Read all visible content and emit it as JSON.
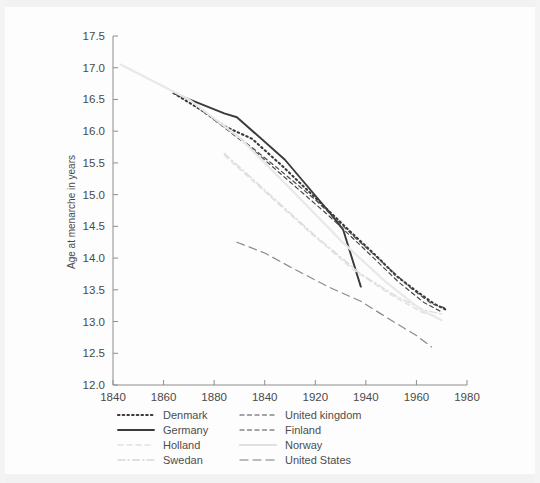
{
  "chart_data": {
    "type": "line",
    "title": "",
    "xlabel": "",
    "ylabel": "Age at menarche in years",
    "xlim": [
      1840,
      1980
    ],
    "ylim": [
      12.0,
      17.5
    ],
    "grid": false,
    "legend_position": "below-axes",
    "x_ticks": [
      1840,
      1860,
      1880,
      1840,
      1920,
      1940,
      1960,
      1980
    ],
    "x_tick_values": [
      1840,
      1860,
      1880,
      1900,
      1920,
      1940,
      1960,
      1980
    ],
    "y_ticks": [
      "12.0",
      "12.5",
      "13.0",
      "13.5",
      "14.0",
      "14.5",
      "15.0",
      "15.5",
      "16.0",
      "16.5",
      "17.0",
      "17.5"
    ],
    "y_tick_values": [
      12.0,
      12.5,
      13.0,
      13.5,
      14.0,
      14.5,
      15.0,
      15.5,
      16.0,
      16.5,
      17.0,
      17.5
    ],
    "series": [
      {
        "name": "Denmark",
        "style": "dotted",
        "color": "#3a3a3a",
        "x": [
          1864,
          1875,
          1884,
          1895,
          1907,
          1920,
          1933,
          1945,
          1952,
          1960,
          1967,
          1972
        ],
        "y": [
          16.6,
          16.33,
          16.08,
          15.88,
          15.45,
          14.95,
          14.45,
          14.0,
          13.72,
          13.48,
          13.28,
          13.18
        ]
      },
      {
        "name": "Germany",
        "style": "solid",
        "color": "#3a3a3a",
        "x": [
          1864,
          1884,
          1889,
          1908,
          1925,
          1931,
          1938
        ],
        "y": [
          16.6,
          16.28,
          16.22,
          15.55,
          14.75,
          14.45,
          13.55
        ]
      },
      {
        "name": "Holland",
        "style": "dashed",
        "color": "#e2e2e2",
        "x": [
          1884,
          1900,
          1918,
          1935,
          1950,
          1962,
          1968
        ],
        "y": [
          15.62,
          15.05,
          14.4,
          13.82,
          13.42,
          13.15,
          13.08
        ]
      },
      {
        "name": "Swedan",
        "style": "dashdot",
        "color": "#dcdcdc",
        "x": [
          1884,
          1902,
          1920,
          1938,
          1952,
          1963,
          1970
        ],
        "y": [
          15.65,
          15.0,
          14.35,
          13.75,
          13.4,
          13.18,
          13.12
        ]
      },
      {
        "name": "United kingdom",
        "style": "dashed-med",
        "color": "#4a4a4a",
        "x": [
          1876,
          1890,
          1905,
          1920,
          1935,
          1948,
          1958,
          1966,
          1971
        ],
        "y": [
          16.3,
          15.9,
          15.42,
          14.92,
          14.35,
          13.88,
          13.52,
          13.28,
          13.22
        ]
      },
      {
        "name": "Finland",
        "style": "dashed-med",
        "color": "#4a4a4a",
        "x": [
          1880,
          1895,
          1910,
          1925,
          1940,
          1953,
          1963,
          1970
        ],
        "y": [
          16.18,
          15.72,
          15.2,
          14.68,
          14.12,
          13.62,
          13.3,
          13.15
        ]
      },
      {
        "name": "Norway",
        "style": "solid-light",
        "color": "#e8e8e8",
        "x": [
          1843,
          1870,
          1890,
          1910,
          1930,
          1948,
          1962,
          1970
        ],
        "y": [
          17.05,
          16.5,
          15.9,
          15.1,
          14.28,
          13.62,
          13.18,
          13.02
        ]
      },
      {
        "name": "United States",
        "style": "longdash",
        "color": "#8a8a8a",
        "x": [
          1889,
          1900,
          1912,
          1925,
          1938,
          1950,
          1960,
          1966
        ],
        "y": [
          14.25,
          14.08,
          13.82,
          13.55,
          13.32,
          13.02,
          12.78,
          12.6
        ]
      }
    ]
  },
  "legend": {
    "column_left": [
      {
        "label": "Denmark",
        "style": "dotted",
        "color": "#3a3a3a"
      },
      {
        "label": "Germany",
        "style": "solid",
        "color": "#3a3a3a"
      },
      {
        "label": "Holland",
        "style": "dashed",
        "color": "#e0e0e0"
      },
      {
        "label": "Swedan",
        "style": "dashdot",
        "color": "#d8d8d8"
      }
    ],
    "column_right": [
      {
        "label": "United kingdom",
        "style": "dashed-med",
        "color": "#4a4a4a"
      },
      {
        "label": "Finland",
        "style": "dashed-med",
        "color": "#4a4a4a"
      },
      {
        "label": "Norway",
        "style": "solid-light",
        "color": "#e0e0e0"
      },
      {
        "label": "United States",
        "style": "longdash",
        "color": "#7a7a7a"
      }
    ]
  }
}
